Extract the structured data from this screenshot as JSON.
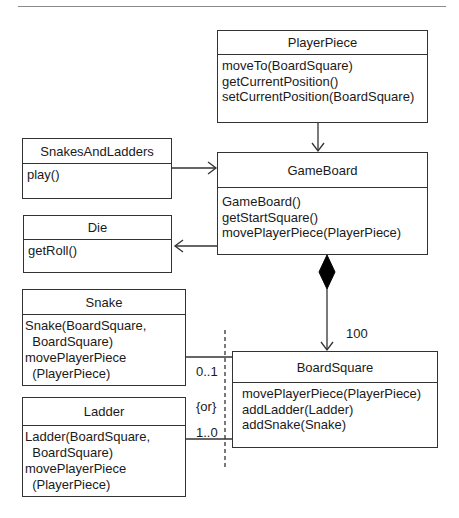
{
  "diagram": {
    "type": "UML class diagram",
    "classes": {
      "player_piece": {
        "name": "PlayerPiece",
        "operations": [
          "moveTo(BoardSquare)",
          "getCurrentPosition()",
          "setCurrentPosition(BoardSquare)"
        ]
      },
      "snakes_and_ladders": {
        "name": "SnakesAndLadders",
        "operations": [
          "play()"
        ]
      },
      "game_board": {
        "name": "GameBoard",
        "operations": [
          "GameBoard()",
          "getStartSquare()",
          "movePlayerPiece(PlayerPiece)"
        ]
      },
      "die": {
        "name": "Die",
        "operations": [
          "getRoll()"
        ]
      },
      "snake": {
        "name": "Snake",
        "operations": [
          "Snake(BoardSquare,",
          "  BoardSquare)",
          "movePlayerPiece",
          "  (PlayerPiece)"
        ]
      },
      "ladder": {
        "name": "Ladder",
        "operations": [
          "Ladder(BoardSquare,",
          "  BoardSquare)",
          "movePlayerPiece",
          "  (PlayerPiece)"
        ]
      },
      "board_square": {
        "name": "BoardSquare",
        "operations": [
          "movePlayerPiece(PlayerPiece)",
          "addLadder(Ladder)",
          "addSnake(Snake)"
        ]
      }
    },
    "relationships": {
      "composition_multiplicity": "100",
      "snake_multiplicity": "0..1",
      "constraint": "{or}",
      "ladder_multiplicity": "1..0"
    },
    "colors": {
      "line": "#333333",
      "rule": "#8a8a8a",
      "background": "#ffffff"
    }
  }
}
